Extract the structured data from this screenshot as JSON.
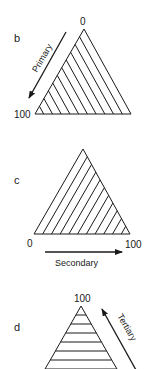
{
  "panels": [
    {
      "id": "b",
      "letter": "b",
      "axis_name": "Primary",
      "tick_start": "0",
      "tick_end": "100",
      "hatch": "parallel to right edge",
      "arrow_direction": "down-left"
    },
    {
      "id": "c",
      "letter": "c",
      "axis_name": "Secondary",
      "tick_start": "0",
      "tick_end": "100",
      "hatch": "parallel to left edge",
      "arrow_direction": "right"
    },
    {
      "id": "d",
      "letter": "d",
      "axis_name": "Tertiary",
      "tick_start": "100",
      "hatch": "horizontal (parallel to base)",
      "arrow_direction": "up-left"
    }
  ],
  "colors": {
    "stroke": "#1a1a1a",
    "background": "#ffffff"
  }
}
